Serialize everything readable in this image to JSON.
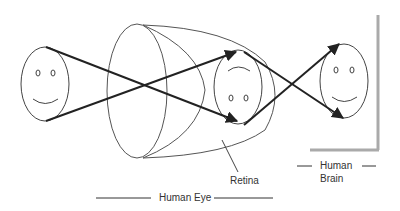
{
  "diagram": {
    "labels": {
      "retina": "Retina",
      "human_eye": "Human Eye",
      "human_brain_line1": "Human",
      "human_brain_line2": "Brain"
    },
    "elements": {
      "object_face": "upright smiley face (object)",
      "lens": "eye lens (ellipse)",
      "eyeball": "eye outline",
      "retina_image": "inverted smiley face on retina",
      "brain_image": "upright smiley face perceived in brain",
      "brain_frame": "gray frame representing brain"
    },
    "colors": {
      "stroke": "#444444",
      "ray": "#222222",
      "frame": "#aaaaaa",
      "text": "#333333"
    }
  }
}
